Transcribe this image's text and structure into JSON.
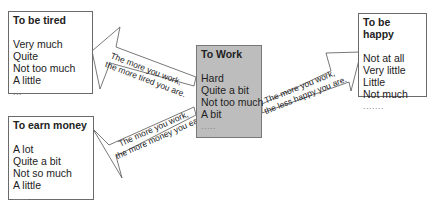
{
  "diagram": {
    "center": {
      "title": "To Work",
      "items": [
        "Hard",
        "Quite a bit",
        "Not too much",
        "A bit",
        "....."
      ],
      "fill": "#bdbdbd"
    },
    "tired": {
      "title": "To be tired",
      "items": [
        "Very much",
        "Quite",
        "Not too much",
        "A little",
        "..."
      ]
    },
    "happy": {
      "title": "To be happy",
      "items": [
        "Not at all",
        "Very little",
        "Little",
        "Not much",
        "......."
      ]
    },
    "money": {
      "title": "To earn money",
      "items": [
        "A lot",
        "Quite a bit",
        "Not so much",
        "A little",
        "....."
      ]
    },
    "arrows": {
      "tired": {
        "line1": "The more you work,",
        "line2": "the more tired you are."
      },
      "happy": {
        "line1": "The more you work,",
        "line2": "the less happy you are."
      },
      "money": {
        "line1": "The more you work,",
        "line2": "the more money you earn."
      }
    }
  }
}
